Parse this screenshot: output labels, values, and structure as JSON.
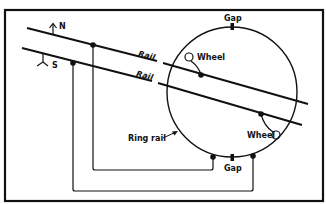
{
  "diagram": {
    "type": "schematic",
    "colors": {
      "ink": "#111111",
      "background": "#ffffff"
    },
    "labels": {
      "north": "N",
      "south": "S",
      "rail_upper": "Rail",
      "rail_lower": "Rail",
      "gap_top": "Gap",
      "gap_bottom": "Gap",
      "wheel_upper": "Wheel",
      "wheel_lower": "Wheel",
      "ring_rail": "Ring rail"
    },
    "icons": {
      "north_arrow": "arrow-up-icon",
      "south_symbol": "y-fork-icon"
    }
  }
}
